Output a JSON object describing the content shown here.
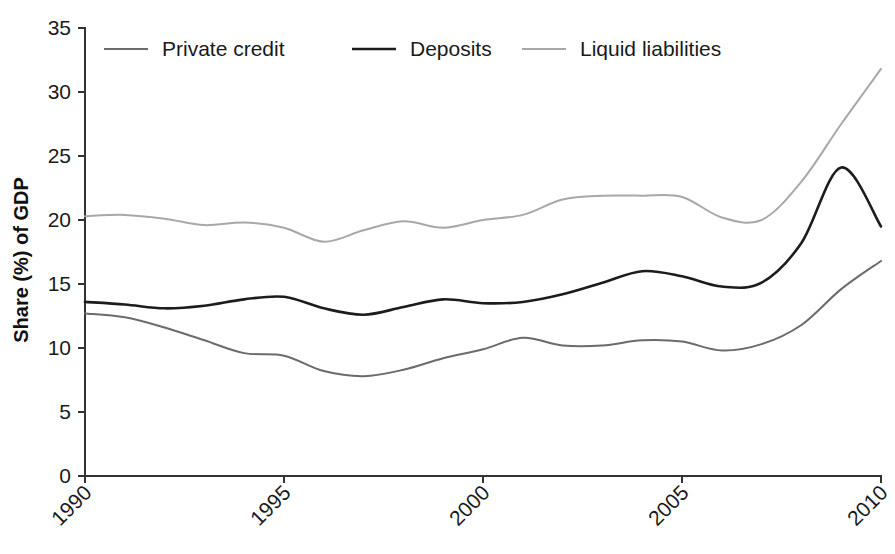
{
  "chart_data": {
    "type": "line",
    "title": "",
    "subtitle": "",
    "xlabel": "",
    "ylabel": "Share (%) of GDP",
    "xlim": [
      1990,
      2010
    ],
    "ylim": [
      0,
      35
    ],
    "yticks": [
      0,
      5,
      10,
      15,
      20,
      25,
      30,
      35
    ],
    "ytick_labels": [
      "0",
      "5",
      "10",
      "15",
      "20",
      "25",
      "30",
      "35"
    ],
    "xticks": [
      1990,
      1995,
      2000,
      2005,
      2010
    ],
    "xtick_labels": [
      "1990",
      "1995",
      "2000",
      "2005",
      "2010"
    ],
    "xtick_rotation_deg": 45,
    "grid": false,
    "legend_position": "top-left-inside",
    "x": [
      1990,
      1991,
      1992,
      1993,
      1994,
      1995,
      1996,
      1997,
      1998,
      1999,
      2000,
      2001,
      2002,
      2003,
      2004,
      2005,
      2006,
      2007,
      2008,
      2009,
      2010
    ],
    "series": [
      {
        "name": "Private credit",
        "color": "#6b6b6b",
        "width": 2.0,
        "values": [
          12.7,
          12.4,
          11.6,
          10.6,
          9.6,
          9.4,
          8.2,
          7.8,
          8.3,
          9.2,
          9.9,
          10.8,
          10.2,
          10.2,
          10.6,
          10.5,
          9.8,
          10.3,
          11.8,
          14.6,
          16.8
        ]
      },
      {
        "name": "Deposits",
        "color": "#1c1c1c",
        "width": 2.6,
        "values": [
          13.6,
          13.4,
          13.1,
          13.3,
          13.8,
          14.0,
          13.1,
          12.6,
          13.2,
          13.8,
          13.5,
          13.6,
          14.2,
          15.1,
          16.0,
          15.6,
          14.8,
          15.1,
          18.2,
          24.1,
          19.5
        ]
      },
      {
        "name": "Liquid liabilities",
        "color": "#a8a8a8",
        "width": 2.0,
        "values": [
          20.3,
          20.4,
          20.1,
          19.6,
          19.8,
          19.4,
          18.3,
          19.2,
          19.9,
          19.4,
          20.0,
          20.4,
          21.6,
          21.9,
          21.9,
          21.8,
          20.2,
          20.0,
          23.0,
          27.5,
          31.8
        ]
      }
    ]
  },
  "legend": {
    "items": [
      {
        "label": "Private credit"
      },
      {
        "label": "Deposits"
      },
      {
        "label": "Liquid liabilities"
      }
    ]
  },
  "axes": {
    "y_title": "Share (%) of GDP"
  }
}
